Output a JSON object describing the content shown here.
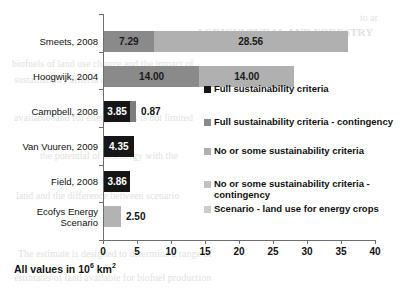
{
  "chart_data": {
    "type": "bar",
    "orientation": "horizontal",
    "stacked": true,
    "title": "",
    "xlabel": "",
    "ylabel": "",
    "xlim": [
      0,
      40
    ],
    "xticks": [
      0,
      5,
      10,
      15,
      20,
      25,
      30,
      35,
      40
    ],
    "grid": false,
    "legend_position": "inside-right",
    "units_note": "All values in 10^6 km2",
    "categories": [
      "Smeets, 2008",
      "Hoogwijk, 2004",
      "Campbell, 2008",
      "Van Vuuren, 2009",
      "Field, 2008",
      "Ecofys Energy Scenario"
    ],
    "series": [
      {
        "name": "Full sustainability criteria",
        "color": "#1a1a1a",
        "values": [
          null,
          null,
          3.85,
          4.35,
          3.86,
          null
        ]
      },
      {
        "name": "Full sustainability criteria - contingency",
        "color": "#7f7f7f",
        "values": [
          7.29,
          14.0,
          0.87,
          null,
          null,
          null
        ]
      },
      {
        "name": "No or some sustainability criteria",
        "color": "#a6a6a6",
        "values": [
          28.56,
          14.0,
          null,
          null,
          null,
          null
        ]
      },
      {
        "name": "No or some sustainability criteria - contingency",
        "color": "#bfbfbf",
        "values": [
          null,
          null,
          null,
          null,
          null,
          null
        ]
      },
      {
        "name": "Scenario - land use for energy crops",
        "color": "#b3b3b3",
        "values": [
          null,
          null,
          null,
          null,
          null,
          2.5
        ]
      }
    ],
    "bars": [
      {
        "category": "Smeets, 2008",
        "total": 35.85,
        "segments": [
          {
            "series": "Full sustainability criteria - contingency",
            "value": 7.29,
            "label": "7.29",
            "color": "#8a8a8a",
            "label_color": "#1a1a1a",
            "label_inside": true
          },
          {
            "series": "No or some sustainability criteria",
            "value": 28.56,
            "label": "28.56",
            "color": "#b0b0b0",
            "label_color": "#1a1a1a",
            "label_inside": true
          }
        ]
      },
      {
        "category": "Hoogwijk, 2004",
        "total": 28.0,
        "segments": [
          {
            "series": "Full sustainability criteria - contingency",
            "value": 14.0,
            "label": "14.00",
            "color": "#8a8a8a",
            "label_color": "#1a1a1a",
            "label_inside": true
          },
          {
            "series": "No or some sustainability criteria",
            "value": 14.0,
            "label": "14.00",
            "color": "#b0b0b0",
            "label_color": "#1a1a1a",
            "label_inside": true
          }
        ]
      },
      {
        "category": "Campbell, 2008",
        "total": 4.72,
        "segments": [
          {
            "series": "Full sustainability criteria",
            "value": 3.85,
            "label": "3.85",
            "color": "#161616",
            "label_color": "#ffffff",
            "label_inside": true
          },
          {
            "series": "Full sustainability criteria - contingency",
            "value": 0.87,
            "label": "0.87",
            "color": "#7d7d7d",
            "label_color": "#111111",
            "label_inside": false
          }
        ]
      },
      {
        "category": "Van Vuuren, 2009",
        "total": 4.35,
        "segments": [
          {
            "series": "Full sustainability criteria",
            "value": 4.35,
            "label": "4.35",
            "color": "#161616",
            "label_color": "#ffffff",
            "label_inside": true
          }
        ]
      },
      {
        "category": "Field, 2008",
        "total": 3.86,
        "segments": [
          {
            "series": "Full sustainability criteria",
            "value": 3.86,
            "label": "3.86",
            "color": "#161616",
            "label_color": "#ffffff",
            "label_inside": true
          }
        ]
      },
      {
        "category": "Ecofys Energy Scenario",
        "total": 2.5,
        "segments": [
          {
            "series": "Scenario - land use for energy crops",
            "value": 2.5,
            "label": "2.50",
            "color": "#b3b3b3",
            "label_color": "#111111",
            "label_inside": false
          }
        ]
      }
    ]
  },
  "axis": {
    "tick_labels": [
      "0",
      "5",
      "10",
      "15",
      "20",
      "25",
      "30",
      "35",
      "40"
    ]
  },
  "category_labels": [
    {
      "lines": [
        "Smeets, 2008"
      ]
    },
    {
      "lines": [
        "Hoogwijk, 2004"
      ]
    },
    {
      "lines": [
        "Campbell, 2008"
      ]
    },
    {
      "lines": [
        "Van Vuuren, 2009"
      ]
    },
    {
      "lines": [
        "Field, 2008"
      ]
    },
    {
      "lines": [
        "Ecofys Energy",
        "Scenario"
      ]
    }
  ],
  "legend": {
    "items": [
      {
        "label": "Full sustainability criteria",
        "color": "#161616"
      },
      {
        "label": "Full sustainability criteria - contingency",
        "color": "#8a8a8a"
      },
      {
        "label": "No or some sustainability criteria",
        "color": "#b0b0b0"
      },
      {
        "label": "No or some sustainability criteria -\ncontingency",
        "color": "#c2c2c2"
      },
      {
        "label": "Scenario - land use for energy crops",
        "color": "#cccccc"
      }
    ]
  },
  "footnote": {
    "prefix": "All values in 10",
    "exponent": "6",
    "suffix": " km",
    "suffix_exponent": "2"
  },
  "background_text": [
    {
      "text": "AGRICULTURAL AND FORESTRY",
      "x": 196,
      "y": 26,
      "size": 11,
      "weight": "bold"
    },
    {
      "text": "to  at",
      "x": 360,
      "y": 12,
      "size": 10,
      "weight": "normal"
    },
    {
      "text": "biofuels  of  land  use  change  and  the  impact  of",
      "x": 12,
      "y": 58,
      "size": 10,
      "weight": "normal"
    },
    {
      "text": "sustainability  criteria  on  the  available  potential",
      "x": 14,
      "y": 74,
      "size": 10,
      "weight": "normal"
    },
    {
      "text": "available  land  for  energy  crops  is  not  limited",
      "x": 14,
      "y": 112,
      "size": 10,
      "weight": "normal"
    },
    {
      "text": "the  potential  of  bioenergy  with  the",
      "x": 40,
      "y": 150,
      "size": 10,
      "weight": "normal"
    },
    {
      "text": "land  and  the  difference  between  scenario",
      "x": 16,
      "y": 190,
      "size": 10,
      "weight": "normal"
    },
    {
      "text": "The  estimate  is  designed  to  determine  a  range  of",
      "x": 18,
      "y": 248,
      "size": 10,
      "weight": "normal"
    },
    {
      "text": "estimates  of  land  available  for  biofuel  production",
      "x": 14,
      "y": 272,
      "size": 10,
      "weight": "normal"
    }
  ]
}
